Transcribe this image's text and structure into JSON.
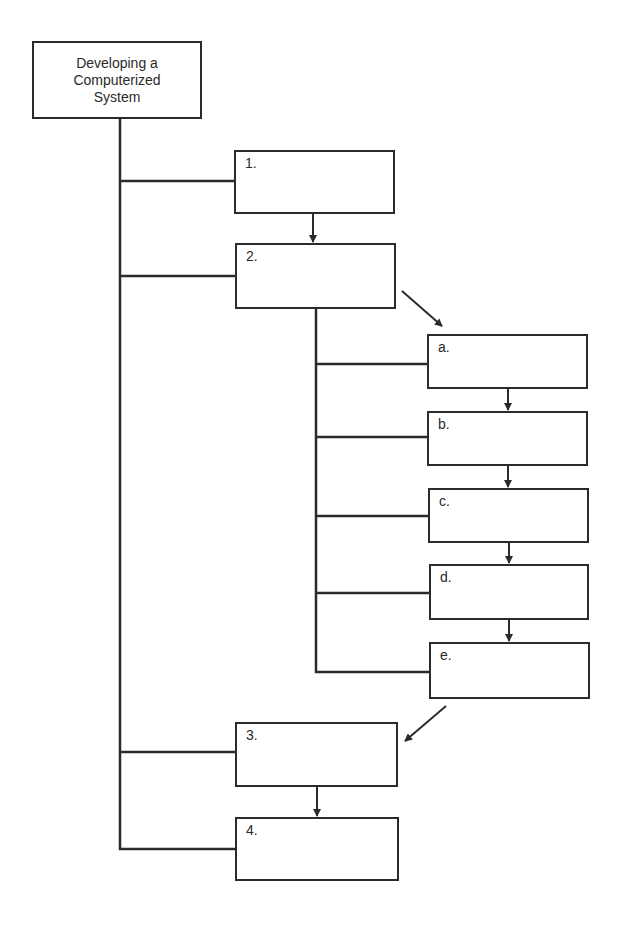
{
  "header": {
    "clipped_text": "Designing a System Design"
  },
  "root": {
    "title": "Developing a\nComputerized\nSystem"
  },
  "steps": [
    {
      "id": "1",
      "label": "1."
    },
    {
      "id": "2",
      "label": "2."
    },
    {
      "id": "3",
      "label": "3."
    },
    {
      "id": "4",
      "label": "4."
    }
  ],
  "substeps": [
    {
      "id": "a",
      "label": "a."
    },
    {
      "id": "b",
      "label": "b."
    },
    {
      "id": "c",
      "label": "c."
    },
    {
      "id": "d",
      "label": "d."
    },
    {
      "id": "e",
      "label": "e."
    }
  ],
  "colors": {
    "line": "#2b2b2b",
    "background": "#ffffff",
    "text": "#2a2a2a"
  }
}
